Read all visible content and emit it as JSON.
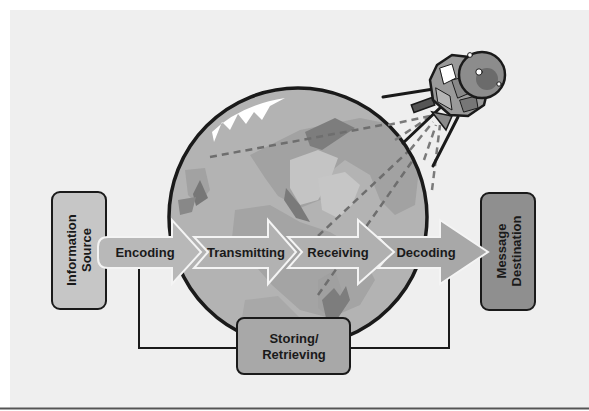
{
  "diagram": {
    "colors": {
      "panel": "#efefef",
      "earth_ocean": "#b3b3b3",
      "earth_land": "#a2a2a2",
      "earth_land_dark": "#7d7d7d",
      "earth_land_light": "#c4c4c4",
      "arrow_fill": "#b0b0b0",
      "source_box": "#c6c6c6",
      "destination_box": "#8f8f8f",
      "storing_box": "#a8a8a8",
      "outline": "#1a1a1a"
    },
    "source": {
      "line1": "Information",
      "line2": "Source"
    },
    "destination": {
      "line1": "Message",
      "line2": "Destination"
    },
    "steps": [
      {
        "label": "Encoding"
      },
      {
        "label": "Transmitting"
      },
      {
        "label": "Receiving"
      },
      {
        "label": "Decoding"
      }
    ],
    "storage": {
      "line1": "Storing/",
      "line2": "Retrieving"
    },
    "icons": {
      "earth": "globe-icon",
      "satellite": "satellite-icon"
    }
  }
}
